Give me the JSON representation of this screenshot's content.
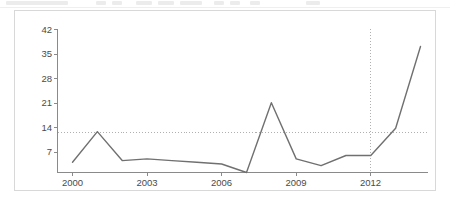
{
  "toolbar": {
    "visible": true,
    "note": "clipped toolbar strip"
  },
  "chart_data": {
    "type": "line",
    "title": "",
    "subtitle": "",
    "xlabel": "",
    "ylabel": "",
    "x": [
      2000,
      2001,
      2002,
      2003,
      2004,
      2005,
      2006,
      2007,
      2008,
      2009,
      2010,
      2011,
      2012,
      2013,
      2014
    ],
    "values": [
      3,
      12,
      3.5,
      4,
      3.5,
      3,
      2.5,
      0,
      20.5,
      4,
      2,
      5,
      5,
      13,
      37
    ],
    "series": [
      {
        "name": "series-1",
        "color": "#707070",
        "values": [
          3,
          12,
          3.5,
          4,
          3.5,
          3,
          2.5,
          0,
          20.5,
          4,
          2,
          5,
          5,
          13,
          37
        ]
      }
    ],
    "categories": [
      "2000",
      "2001",
      "2002",
      "2003",
      "2004",
      "2005",
      "2006",
      "2007",
      "2008",
      "2009",
      "2010",
      "2011",
      "2012",
      "2013",
      "2014"
    ],
    "ylim": [
      0,
      42
    ],
    "xlim": [
      2000,
      2014
    ],
    "yticks": [
      7,
      14,
      21,
      28,
      35,
      42
    ],
    "ytick_labels": [
      "7",
      "14",
      "21",
      "28",
      "35",
      "42"
    ],
    "xticks": [
      2000,
      2003,
      2006,
      2009,
      2012
    ],
    "xtick_labels": [
      "2000",
      "2003",
      "2006",
      "2009",
      "2012"
    ],
    "grid": false,
    "legend": null,
    "legend_position": "none",
    "annotations": [
      {
        "name": "horizontal-reference-line",
        "orientation": "horizontal",
        "value": 11.7,
        "style": "dotted",
        "color": "#b0b0b0"
      },
      {
        "name": "vertical-reference-line",
        "orientation": "vertical",
        "value": 2012,
        "style": "dotted",
        "color": "#b0b0b0"
      }
    ]
  },
  "axis": {
    "y_label_0": "42",
    "y_label_1": "35",
    "y_label_2": "28",
    "y_label_3": "21",
    "y_label_4": "14",
    "y_label_5": "7",
    "x_label_0": "2000",
    "x_label_1": "2003",
    "x_label_2": "2006",
    "x_label_3": "2009",
    "x_label_4": "2012"
  }
}
